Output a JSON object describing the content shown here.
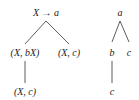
{
  "left_tree": {
    "root": "X → a",
    "child_left": "(X, bX)",
    "child_right": "(X, c)",
    "grandchild": "(X, c)"
  },
  "right_tree": {
    "root": "a",
    "child_left": "b",
    "child_right": "c",
    "grandchild": "c"
  }
}
